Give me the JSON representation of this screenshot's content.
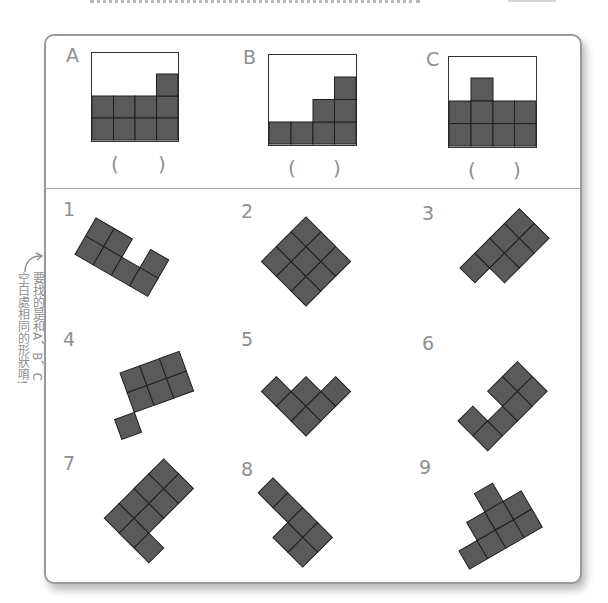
{
  "colors": {
    "tile": "#5a5a5a",
    "tile_line": "#1f1f1f",
    "label": "#8f8f8f",
    "frame": "#9a9a9a"
  },
  "hint": {
    "line1": "要找的是和A、B、C",
    "line2": "空白處相同的形狀唷!",
    "arrow_icon": "curved-arrow-up"
  },
  "targets": [
    {
      "label": "A",
      "answer_left": "(",
      "answer_right": ")",
      "grid": "4 cols x 3 rows; filled: bottom 2 full rows + top-right cell"
    },
    {
      "label": "B",
      "answer_left": "(",
      "answer_right": ")",
      "grid": "4 cols x 4 rows; staircase heights 1,1,2,3"
    },
    {
      "label": "C",
      "answer_left": "(",
      "answer_right": ")",
      "grid": "4 cols x 3 rows; filled: bottom 2 full rows + top cell in col 2"
    }
  ],
  "options": [
    {
      "label": "1",
      "cells": 7
    },
    {
      "label": "2",
      "cells": 9
    },
    {
      "label": "3",
      "cells": 7
    },
    {
      "label": "4",
      "cells": 7
    },
    {
      "label": "5",
      "cells": 7
    },
    {
      "label": "6",
      "cells": 7
    },
    {
      "label": "7",
      "cells": 9
    },
    {
      "label": "8",
      "cells": 6
    },
    {
      "label": "9",
      "cells": 8
    }
  ]
}
